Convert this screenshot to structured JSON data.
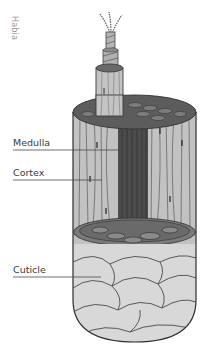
{
  "figure": {
    "credit": "Habia",
    "labels": {
      "medulla": "Medulla",
      "cortex": "Cortex",
      "cuticle": "Cuticle"
    },
    "colors": {
      "background": "#ffffff",
      "outline": "#3a3a3a",
      "cortex_fill": "#bdbdbd",
      "medulla_fill": "#4a4a4a",
      "cuticle_fill": "#d6d6d6",
      "cross_section_fill": "#6f6f6f",
      "label_text": "#3a3a3a",
      "credit_text": "#9a9a9a"
    }
  }
}
